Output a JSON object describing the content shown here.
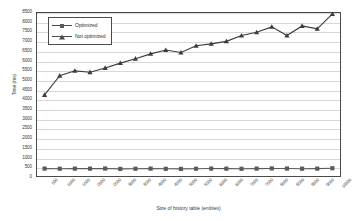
{
  "chart_data": {
    "type": "line",
    "title": "",
    "xlabel": "Size of history table (entities)",
    "ylabel": "Time (ms)",
    "categories": [
      "500",
      "1000",
      "1500",
      "2000",
      "2500",
      "3000",
      "3500",
      "4000",
      "4500",
      "5000",
      "5500",
      "6000",
      "6500",
      "7000",
      "7500",
      "8000",
      "8500",
      "9000",
      "9500",
      "10000"
    ],
    "yticks": [
      "0",
      "500",
      "1000",
      "1500",
      "2000",
      "2500",
      "3000",
      "3500",
      "4000",
      "4500",
      "5000",
      "5500",
      "6000",
      "6500",
      "7000",
      "7500",
      "8000",
      "8500"
    ],
    "ylim": [
      0,
      8500
    ],
    "grid": "horizontal",
    "legend_position": "upper-left-inside",
    "series": [
      {
        "name": "Optimized",
        "marker": "square",
        "color": "#5a5a5a",
        "values": [
          430,
          425,
          430,
          428,
          435,
          415,
          425,
          430,
          420,
          415,
          425,
          432,
          428,
          420,
          430,
          440,
          435,
          425,
          430,
          450
        ]
      },
      {
        "name": "Not optimized",
        "marker": "triangle",
        "color": "#3c3c3c",
        "values": [
          4250,
          5250,
          5500,
          5430,
          5650,
          5900,
          6130,
          6380,
          6580,
          6450,
          6800,
          6900,
          7030,
          7330,
          7500,
          7780,
          7330,
          7830,
          7680,
          8450
        ]
      }
    ]
  },
  "axes": {
    "y_title": "Time (ms)",
    "x_title": "Size of history table (entities)"
  },
  "legend": {
    "items": [
      {
        "label": "Optimized",
        "marker": "square-marker-icon"
      },
      {
        "label": "Not optimized",
        "marker": "triangle-marker-icon"
      }
    ]
  },
  "colors": {
    "grid": "#d8d8d8",
    "frame": "#4a4a4a",
    "optimized": "#5a5a5a",
    "not_optimized": "#3c3c3c",
    "text": "#3a3a3a",
    "background": "#ffffff"
  }
}
